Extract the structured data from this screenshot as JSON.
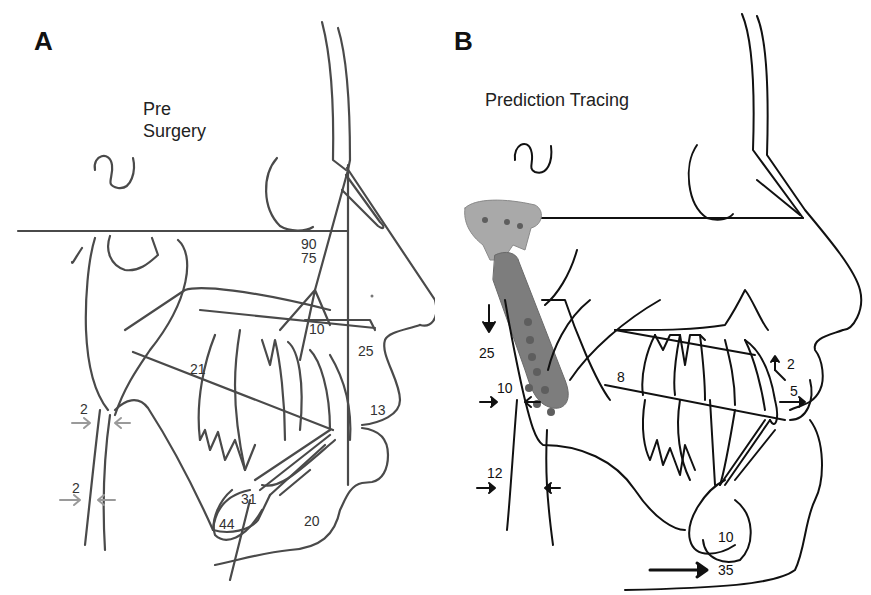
{
  "figure": {
    "panels": [
      {
        "letter": "A",
        "title_line1": "Pre",
        "title_line2": "Surgery",
        "line_color": "#4a4a4a",
        "arrow_color": "#9a9a9a",
        "measurements": [
          "90",
          "75",
          "10",
          "25",
          "21",
          "13",
          "2",
          "2",
          "31",
          "44",
          "20"
        ]
      },
      {
        "letter": "B",
        "title": "Prediction Tracing",
        "line_color": "#111111",
        "implant_color": "#7d7d7d",
        "measurements": [
          "25",
          "10",
          "12",
          "8",
          "2",
          "5",
          "10",
          "35"
        ]
      }
    ]
  }
}
